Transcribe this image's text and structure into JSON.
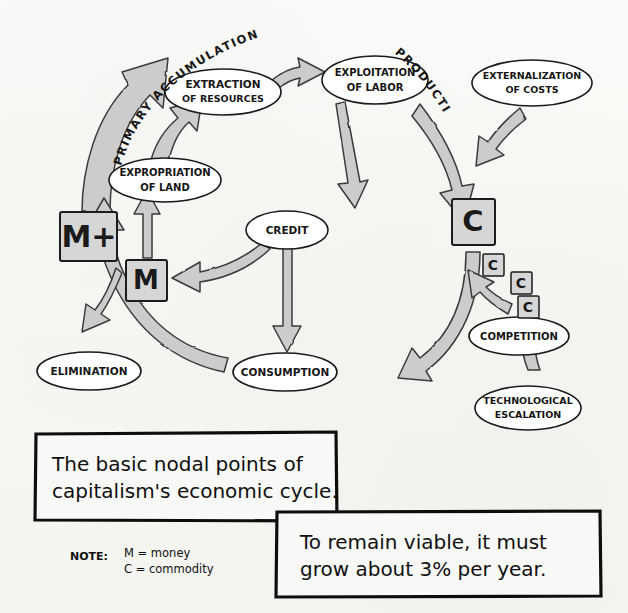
{
  "diagram": {
    "title_caption": "The basic nodal points of capitalism's economic cycle.",
    "caption_line1": "The basic nodal points of",
    "caption_line2": "capitalism's economic cycle.",
    "caption2_line1": "To remain viable, it must",
    "caption2_line2": "grow about 3% per year.",
    "note_label": "NOTE:",
    "note_line1": "M = money",
    "note_line2": "C = commodity",
    "colors": {
      "ink": "#161616",
      "arrow_fill": "#cccccc",
      "arrow_stroke": "#3a3a3a",
      "box_fill": "#d6d6d6",
      "node_fill": "#ffffff",
      "paper": "#f8f8f6"
    },
    "arc_labels": [
      {
        "name": "primary-accumulation",
        "text": "PRIMARY ACCUMULATION"
      },
      {
        "name": "production",
        "text": "PRODUCTION"
      }
    ],
    "nodes": [
      {
        "id": "extraction",
        "shape": "ellipse",
        "line1": "EXTRACTION",
        "line2": "OF RESOURCES"
      },
      {
        "id": "exploitation",
        "shape": "ellipse",
        "line1": "EXPLOITATION",
        "line2": "OF  LABOR"
      },
      {
        "id": "externalization",
        "shape": "ellipse",
        "line1": "EXTERNALIZATION",
        "line2": "OF COSTS"
      },
      {
        "id": "expropriation",
        "shape": "ellipse",
        "line1": "EXPROPRIATION",
        "line2": "OF LAND"
      },
      {
        "id": "credit",
        "shape": "ellipse",
        "line1": "CREDIT",
        "line2": ""
      },
      {
        "id": "consumption",
        "shape": "ellipse",
        "line1": "CONSUMPTION",
        "line2": ""
      },
      {
        "id": "elimination",
        "shape": "ellipse",
        "line1": "ELIMINATION",
        "line2": ""
      },
      {
        "id": "competition",
        "shape": "ellipse",
        "line1": "COMPETITION",
        "line2": ""
      },
      {
        "id": "technological",
        "shape": "ellipse",
        "line1": "TECHNOLOGICAL",
        "line2": "ESCALATION"
      }
    ],
    "boxes": [
      {
        "id": "m-plus",
        "glyph": "M+",
        "size": "large"
      },
      {
        "id": "m",
        "glyph": "M",
        "size": "medium"
      },
      {
        "id": "c-main",
        "glyph": "C",
        "size": "large"
      },
      {
        "id": "c-1",
        "glyph": "C",
        "size": "small"
      },
      {
        "id": "c-2",
        "glyph": "C",
        "size": "small"
      },
      {
        "id": "c-3",
        "glyph": "C",
        "size": "small"
      }
    ],
    "flow_edges": [
      {
        "from": "m-plus",
        "to": "primary-accumulation-top"
      },
      {
        "from": "expropriation",
        "to": "extraction"
      },
      {
        "from": "extraction",
        "to": "exploitation"
      },
      {
        "from": "exploitation",
        "to": "c-main"
      },
      {
        "from": "externalization",
        "to": "c-main"
      },
      {
        "from": "exploitation",
        "to": "credit"
      },
      {
        "from": "credit",
        "to": "m"
      },
      {
        "from": "credit",
        "to": "consumption"
      },
      {
        "from": "m",
        "to": "expropriation"
      },
      {
        "from": "c-main",
        "to": "consumption"
      },
      {
        "from": "competition",
        "to": "c-main-stream"
      },
      {
        "from": "technological",
        "to": "competition"
      },
      {
        "from": "consumption",
        "to": "m-plus"
      },
      {
        "from": "m-plus-branch",
        "to": "elimination"
      }
    ]
  }
}
